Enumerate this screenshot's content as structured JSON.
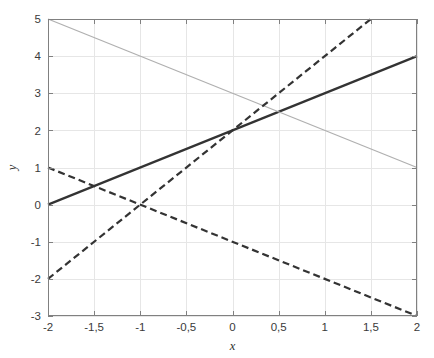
{
  "figure": {
    "title": "",
    "background": "#ffffff",
    "plot_area": {
      "left": 48,
      "top": 19,
      "right": 417,
      "bottom": 316
    },
    "axis_color": "#808080",
    "grid_color": "#e6e6e6"
  },
  "chart_data": {
    "type": "line",
    "title": "",
    "xlabel": "x",
    "ylabel": "y",
    "xlim": [
      -2,
      2
    ],
    "ylim": [
      -3,
      5
    ],
    "xticks": [
      -2,
      -1.5,
      -1,
      -0.5,
      0,
      0.5,
      1,
      1.5,
      2
    ],
    "xtick_labels": [
      "-2",
      "-1,5",
      "-1",
      "-0,5",
      "0",
      "0,5",
      "1",
      "1,5",
      "2"
    ],
    "yticks": [
      -3,
      -2,
      -1,
      0,
      1,
      2,
      3,
      4,
      5
    ],
    "ytick_labels": [
      "-3",
      "-2",
      "-1",
      "0",
      "1",
      "2",
      "3",
      "4",
      "5"
    ],
    "grid": true,
    "legend": "none",
    "decimal_separator": ",",
    "series": [
      {
        "name": "y = x + 2",
        "style": "solid",
        "color": "#333333",
        "width": 2.2,
        "x": [
          -2,
          2
        ],
        "values": [
          0,
          4
        ],
        "slope": 1,
        "intercept": 2
      },
      {
        "name": "y = -x + 3",
        "style": "solid",
        "color": "#b0b0b0",
        "width": 1.3,
        "x": [
          -2,
          2
        ],
        "values": [
          5,
          1
        ],
        "slope": -1,
        "intercept": 3
      },
      {
        "name": "y = 2x + 2",
        "style": "dashed",
        "color": "#333333",
        "width": 2.2,
        "x": [
          -2,
          1.5
        ],
        "values": [
          -2,
          5
        ],
        "slope": 2,
        "intercept": 2
      },
      {
        "name": "y = -x - 1",
        "style": "dashed",
        "color": "#333333",
        "width": 2.2,
        "x": [
          -2,
          2
        ],
        "values": [
          1,
          -3
        ],
        "slope": -1,
        "intercept": -1
      }
    ],
    "intersections": [
      {
        "x": 0,
        "y": 2,
        "between": [
          "y = x + 2",
          "y = 2x + 2"
        ]
      },
      {
        "x": -1.5,
        "y": 0.5,
        "between": [
          "y = x + 2",
          "y = -x - 1"
        ]
      },
      {
        "x": -1,
        "y": 0,
        "between": [
          "y = 2x + 2",
          "y = -x - 1"
        ]
      },
      {
        "x": 0.5,
        "y": 2.5,
        "between": [
          "y = x + 2",
          "y = -x + 3"
        ]
      }
    ]
  }
}
